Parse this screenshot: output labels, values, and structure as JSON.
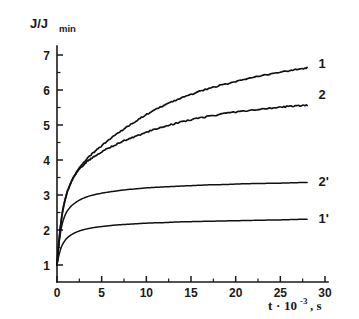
{
  "chart_data": {
    "type": "line",
    "title": "",
    "xlabel": "t·10⁻³, s",
    "xlabel_parts": {
      "base": "t",
      "dot": "·",
      "ten": "10",
      "exponent": "-3",
      "unit": ", s"
    },
    "ylabel": "J/J_min",
    "ylabel_parts": {
      "main": "J/J",
      "subscript": "min"
    },
    "xlim": [
      0,
      30
    ],
    "ylim": [
      0.55,
      7.45
    ],
    "grid": false,
    "legend_position": "right-inline-curve-labels",
    "xticks": [
      0,
      5,
      10,
      15,
      20,
      25,
      30
    ],
    "xtick_labels": [
      "0",
      "5",
      "10",
      "15",
      "20",
      "25",
      "30"
    ],
    "xminor_step": 2.5,
    "yticks": [
      1,
      2,
      3,
      4,
      5,
      6,
      7
    ],
    "ytick_labels": [
      "1",
      "2",
      "3",
      "4",
      "5",
      "6",
      "7"
    ],
    "yminor_step": 0.5,
    "series": [
      {
        "name": "1",
        "label": "1",
        "style": "noisy",
        "label_x": 28.6,
        "label_y": 6.75,
        "x": [
          0,
          0.2,
          0.5,
          0.9,
          1.4,
          2.0,
          2.7,
          3.5,
          4.4,
          5.4,
          6.5,
          7.7,
          9.0,
          10.4,
          11.9,
          13.5,
          15.2,
          17.0,
          18.9,
          20.9,
          23.0,
          25.2,
          26.5,
          28.0
        ],
        "y": [
          1.0,
          1.62,
          2.32,
          2.86,
          3.26,
          3.58,
          3.84,
          4.07,
          4.28,
          4.49,
          4.71,
          4.92,
          5.14,
          5.35,
          5.55,
          5.73,
          5.89,
          6.04,
          6.17,
          6.29,
          6.41,
          6.52,
          6.57,
          6.63
        ]
      },
      {
        "name": "2",
        "label": "2",
        "style": "noisy",
        "label_x": 28.6,
        "label_y": 5.85,
        "x": [
          0,
          0.2,
          0.5,
          0.9,
          1.4,
          2.0,
          2.7,
          3.5,
          4.4,
          5.4,
          6.5,
          7.7,
          9.0,
          10.4,
          11.9,
          13.5,
          15.2,
          17.0,
          18.9,
          20.9,
          23.0,
          25.2,
          26.5,
          28.0
        ],
        "y": [
          1.0,
          1.62,
          2.32,
          2.86,
          3.26,
          3.56,
          3.79,
          3.98,
          4.14,
          4.29,
          4.43,
          4.57,
          4.7,
          4.83,
          4.95,
          5.06,
          5.16,
          5.25,
          5.33,
          5.4,
          5.46,
          5.51,
          5.54,
          5.56
        ]
      },
      {
        "name": "2'",
        "label": "2'",
        "style": "smooth",
        "label_x": 28.6,
        "label_y": 3.38,
        "x": [
          0,
          0.2,
          0.5,
          0.9,
          1.4,
          2.0,
          2.7,
          3.5,
          4.4,
          5.4,
          6.5,
          7.7,
          9.0,
          10.4,
          11.9,
          13.5,
          15.2,
          17.0,
          18.9,
          20.9,
          23.0,
          25.2,
          26.5,
          28.0
        ],
        "y": [
          1.0,
          1.55,
          2.08,
          2.42,
          2.63,
          2.77,
          2.88,
          2.96,
          3.02,
          3.07,
          3.11,
          3.15,
          3.18,
          3.21,
          3.23,
          3.25,
          3.27,
          3.29,
          3.3,
          3.32,
          3.33,
          3.34,
          3.35,
          3.36
        ]
      },
      {
        "name": "1'",
        "label": "1'",
        "style": "smooth",
        "label_x": 28.6,
        "label_y": 2.32,
        "x": [
          0,
          0.2,
          0.5,
          0.9,
          1.4,
          2.0,
          2.7,
          3.5,
          4.4,
          5.4,
          6.5,
          7.7,
          9.0,
          10.4,
          11.9,
          13.5,
          15.2,
          17.0,
          18.9,
          20.9,
          23.0,
          25.2,
          26.5,
          28.0
        ],
        "y": [
          1.0,
          1.26,
          1.52,
          1.7,
          1.83,
          1.92,
          1.99,
          2.04,
          2.08,
          2.11,
          2.14,
          2.16,
          2.18,
          2.2,
          2.21,
          2.23,
          2.24,
          2.25,
          2.26,
          2.27,
          2.28,
          2.29,
          2.3,
          2.31
        ]
      }
    ],
    "colors": {
      "curve": "#111111",
      "axis": "#1a1a1a",
      "background": "#ffffff"
    }
  }
}
